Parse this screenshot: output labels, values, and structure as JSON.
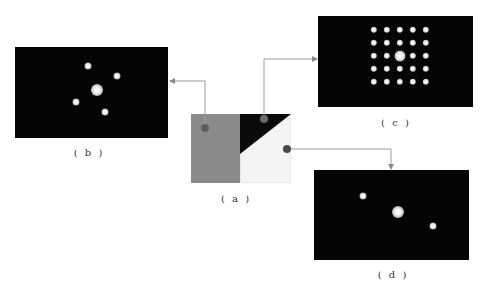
{
  "figure": {
    "panels": [
      {
        "id": "a",
        "label": "( a )",
        "description": "composite pattern: gray block + black triangle + white area"
      },
      {
        "id": "b",
        "label": "( b )",
        "spots": [
          {
            "x": 73,
            "y": 19,
            "r": 3.5
          },
          {
            "x": 102,
            "y": 29,
            "r": 3.5
          },
          {
            "x": 82,
            "y": 43,
            "r": 6
          },
          {
            "x": 61,
            "y": 55,
            "r": 3.5
          },
          {
            "x": 90,
            "y": 65,
            "r": 3.5
          }
        ]
      },
      {
        "id": "c",
        "label": "( c )",
        "grid": {
          "rows": 5,
          "cols": 5,
          "x0": 56,
          "y0": 14,
          "dx": 13,
          "dy": 13,
          "r": 3.2,
          "center_r": 5.5
        }
      },
      {
        "id": "d",
        "label": "( d )",
        "spots": [
          {
            "x": 49,
            "y": 26,
            "r": 3.5
          },
          {
            "x": 84,
            "y": 42,
            "r": 6
          },
          {
            "x": 119,
            "y": 56,
            "r": 3.5
          }
        ]
      }
    ],
    "colors": {
      "background": "#ffffff",
      "panel": "#050505",
      "gray_block": "#8a8a8a",
      "triangle": "#0a0a0a",
      "white_block": "#f4f4f4",
      "connector": "#9a9a9a"
    }
  }
}
